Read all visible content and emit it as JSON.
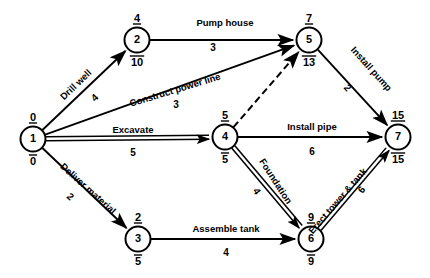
{
  "diagram": {
    "type": "activity-on-arc-network",
    "nodes": [
      {
        "id": "1",
        "label": "1",
        "cx": 33,
        "cy": 139,
        "early": "0",
        "late": "0"
      },
      {
        "id": "2",
        "label": "2",
        "cx": 137,
        "cy": 40,
        "early": "4",
        "late": "10"
      },
      {
        "id": "3",
        "label": "3",
        "cx": 138,
        "cy": 239,
        "early": "2",
        "late": "5"
      },
      {
        "id": "4",
        "label": "4",
        "cx": 225,
        "cy": 137,
        "early": "5",
        "late": "5"
      },
      {
        "id": "5",
        "label": "5",
        "cx": 309,
        "cy": 40,
        "early": "7",
        "late": "13"
      },
      {
        "id": "6",
        "label": "6",
        "cx": 311,
        "cy": 239,
        "early": "9",
        "late": "9"
      },
      {
        "id": "7",
        "label": "7",
        "cx": 398,
        "cy": 137,
        "early": "15",
        "late": "15"
      }
    ],
    "edges": [
      {
        "id": "e-1-2",
        "from": "1",
        "to": "2",
        "label": "Drill well",
        "duration": "4",
        "style": "single",
        "label_rotation": -44,
        "label_x": 78,
        "label_y": 87,
        "dur_x": 97,
        "dur_y": 100
      },
      {
        "id": "e-1-5",
        "from": "1",
        "to": "5",
        "label": "Construct power line",
        "duration": "3",
        "style": "single",
        "label_rotation": -17,
        "label_x": 176,
        "label_y": 93,
        "dur_x": 176,
        "dur_y": 108
      },
      {
        "id": "e-1-4",
        "from": "1",
        "to": "4",
        "label": "Excavate",
        "duration": "5",
        "style": "critical",
        "label_rotation": 0,
        "label_x": 133,
        "label_y": 133,
        "dur_x": 133,
        "dur_y": 156
      },
      {
        "id": "e-1-3",
        "from": "1",
        "to": "3",
        "label": "Deliver material",
        "duration": "2",
        "style": "single",
        "label_rotation": 42,
        "label_x": 86,
        "label_y": 191,
        "dur_x": 68,
        "dur_y": 199
      },
      {
        "id": "e-2-5",
        "from": "2",
        "to": "5",
        "label": "Pump house",
        "duration": "3",
        "style": "single",
        "label_rotation": 0,
        "label_x": 225,
        "label_y": 26,
        "dur_x": 213,
        "dur_y": 51
      },
      {
        "id": "e-4-5",
        "from": "4",
        "to": "5",
        "label": "",
        "duration": "",
        "style": "dashed",
        "label_rotation": 0,
        "label_x": 0,
        "label_y": 0,
        "dur_x": 0,
        "dur_y": 0
      },
      {
        "id": "e-5-7",
        "from": "5",
        "to": "7",
        "label": "Install pump",
        "duration": "2",
        "style": "single",
        "label_rotation": 48,
        "label_x": 369,
        "label_y": 71,
        "dur_x": 345,
        "dur_y": 90
      },
      {
        "id": "e-4-7",
        "from": "4",
        "to": "7",
        "label": "Install pipe",
        "duration": "6",
        "style": "single",
        "label_rotation": 0,
        "label_x": 312,
        "label_y": 130,
        "dur_x": 312,
        "dur_y": 155
      },
      {
        "id": "e-4-6",
        "from": "4",
        "to": "6",
        "label": "Foundation",
        "duration": "4",
        "style": "critical",
        "label_rotation": 57,
        "label_x": 273,
        "label_y": 183,
        "dur_x": 254,
        "dur_y": 193
      },
      {
        "id": "e-3-6",
        "from": "3",
        "to": "6",
        "label": "Assemble tank",
        "duration": "4",
        "style": "single",
        "label_rotation": 0,
        "label_x": 226,
        "label_y": 232,
        "dur_x": 226,
        "dur_y": 256
      },
      {
        "id": "e-6-7",
        "from": "6",
        "to": "7",
        "label": "Erect tower & tank",
        "duration": "6",
        "style": "critical",
        "label_rotation": -49,
        "label_x": 340,
        "label_y": 203,
        "dur_x": 364,
        "dur_y": 192
      }
    ],
    "legend": {
      "node_top_meaning": "earliest event time",
      "node_bottom_meaning": "latest event time"
    },
    "colors": {
      "stroke": "#000000",
      "background": "#ffffff",
      "node_fill": "#ffffff"
    }
  }
}
